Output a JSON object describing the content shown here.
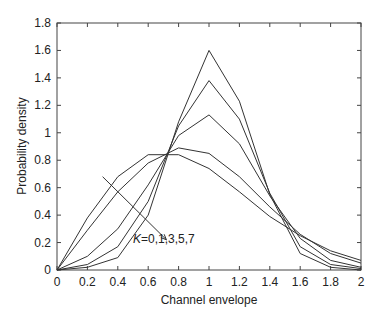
{
  "chart_data": {
    "type": "line",
    "title": "",
    "xlabel": "Channel envelope",
    "ylabel": "Probability density",
    "xlim": [
      0,
      2
    ],
    "ylim": [
      0,
      1.8
    ],
    "grid": false,
    "x_ticks": [
      "0",
      "0.2",
      "0.4",
      "0.6",
      "0.8",
      "1",
      "1.2",
      "1.4",
      "1.6",
      "1.8",
      "2"
    ],
    "y_ticks": [
      "0",
      "0.2",
      "0.4",
      "0.6",
      "0.8",
      "1",
      "1.2",
      "1.4",
      "1.6",
      "1.8"
    ],
    "annotation": {
      "text": "K=0,1,3,5,7",
      "arrow_from": [
        0.3,
        0.68
      ],
      "arrow_to": [
        0.72,
        0.22
      ]
    },
    "x": [
      0,
      0.2,
      0.4,
      0.6,
      0.8,
      1.0,
      1.2,
      1.4,
      1.6,
      1.8,
      2.0
    ],
    "series": [
      {
        "name": "K=0",
        "values": [
          0,
          0.38,
          0.68,
          0.84,
          0.84,
          0.74,
          0.57,
          0.39,
          0.25,
          0.14,
          0.07
        ]
      },
      {
        "name": "K=1",
        "values": [
          0,
          0.29,
          0.57,
          0.78,
          0.89,
          0.85,
          0.68,
          0.46,
          0.26,
          0.12,
          0.05
        ]
      },
      {
        "name": "K=3",
        "values": [
          0,
          0.1,
          0.3,
          0.62,
          0.98,
          1.13,
          0.92,
          0.54,
          0.23,
          0.07,
          0.02
        ]
      },
      {
        "name": "K=5",
        "values": [
          0,
          0.04,
          0.17,
          0.5,
          1.05,
          1.38,
          1.1,
          0.56,
          0.17,
          0.04,
          0.01
        ]
      },
      {
        "name": "K=7",
        "values": [
          0,
          0.02,
          0.09,
          0.4,
          1.08,
          1.6,
          1.23,
          0.55,
          0.12,
          0.02,
          0.0
        ]
      }
    ]
  }
}
